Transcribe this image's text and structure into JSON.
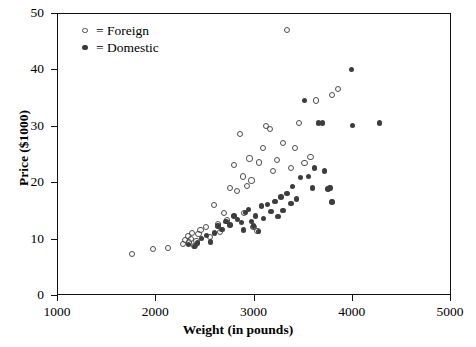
{
  "chart_data": {
    "type": "scatter",
    "title": "",
    "xlabel": "Weight (in pounds)",
    "ylabel": "Price ($1000)",
    "xlim": [
      1000,
      5000
    ],
    "ylim": [
      0,
      50
    ],
    "xticks": [
      1000,
      2000,
      3000,
      4000,
      5000
    ],
    "yticks": [
      0,
      10,
      20,
      30,
      40,
      50
    ],
    "grid": false,
    "legend_position": "upper-left-inside",
    "series": [
      {
        "name": "Foreign",
        "marker": "open-circle",
        "color": "#4d4d4d",
        "points": [
          [
            1760,
            7.3
          ],
          [
            1980,
            8.2
          ],
          [
            2130,
            8.4
          ],
          [
            2280,
            9.1
          ],
          [
            2300,
            9.8
          ],
          [
            2330,
            10.4
          ],
          [
            2340,
            9.3
          ],
          [
            2360,
            10.0
          ],
          [
            2370,
            11.0
          ],
          [
            2400,
            8.7
          ],
          [
            2420,
            9.6
          ],
          [
            2440,
            10.8
          ],
          [
            2460,
            11.5
          ],
          [
            2520,
            12.0
          ],
          [
            2560,
            10.3
          ],
          [
            2600,
            16.0
          ],
          [
            2640,
            12.6
          ],
          [
            2660,
            11.2
          ],
          [
            2700,
            14.6
          ],
          [
            2730,
            13.2
          ],
          [
            2760,
            19.0
          ],
          [
            2800,
            23.0
          ],
          [
            2830,
            18.5
          ],
          [
            2860,
            28.5
          ],
          [
            2890,
            21.0
          ],
          [
            2900,
            14.5
          ],
          [
            2930,
            19.3
          ],
          [
            2960,
            24.2
          ],
          [
            2980,
            20.3
          ],
          [
            3000,
            12.0
          ],
          [
            3040,
            11.4
          ],
          [
            3060,
            23.5
          ],
          [
            3100,
            26.0
          ],
          [
            3130,
            30.0
          ],
          [
            3170,
            29.5
          ],
          [
            3200,
            22.0
          ],
          [
            3240,
            24.0
          ],
          [
            3300,
            27.0
          ],
          [
            3340,
            47.0
          ],
          [
            3380,
            22.5
          ],
          [
            3420,
            26.0
          ],
          [
            3460,
            30.5
          ],
          [
            3520,
            23.4
          ],
          [
            3580,
            24.5
          ],
          [
            3640,
            34.5
          ],
          [
            3800,
            35.5
          ],
          [
            3860,
            36.5
          ]
        ]
      },
      {
        "name": "Domestic",
        "marker": "filled-circle",
        "color": "#3d3d3d",
        "points": [
          [
            2340,
            9.0
          ],
          [
            2400,
            8.6
          ],
          [
            2430,
            9.2
          ],
          [
            2470,
            10.0
          ],
          [
            2520,
            10.6
          ],
          [
            2560,
            9.4
          ],
          [
            2600,
            11.0
          ],
          [
            2640,
            12.2
          ],
          [
            2680,
            11.6
          ],
          [
            2720,
            13.0
          ],
          [
            2760,
            12.4
          ],
          [
            2800,
            14.0
          ],
          [
            2840,
            13.4
          ],
          [
            2880,
            12.8
          ],
          [
            2900,
            11.5
          ],
          [
            2920,
            14.6
          ],
          [
            2950,
            15.2
          ],
          [
            2980,
            13.0
          ],
          [
            3000,
            12.2
          ],
          [
            3020,
            14.0
          ],
          [
            3050,
            11.3
          ],
          [
            3080,
            15.8
          ],
          [
            3100,
            13.6
          ],
          [
            3140,
            16.0
          ],
          [
            3180,
            14.8
          ],
          [
            3220,
            16.6
          ],
          [
            3250,
            13.9
          ],
          [
            3280,
            17.4
          ],
          [
            3300,
            15.0
          ],
          [
            3340,
            18.0
          ],
          [
            3380,
            16.2
          ],
          [
            3400,
            19.2
          ],
          [
            3440,
            17.0
          ],
          [
            3480,
            20.8
          ],
          [
            3520,
            34.5
          ],
          [
            3560,
            21.0
          ],
          [
            3600,
            19.0
          ],
          [
            3620,
            22.5
          ],
          [
            3660,
            30.5
          ],
          [
            3700,
            30.5
          ],
          [
            3720,
            22.0
          ],
          [
            3760,
            18.8
          ],
          [
            3780,
            19.0
          ],
          [
            3800,
            16.5
          ],
          [
            4000,
            40.0
          ],
          [
            4010,
            30.0
          ],
          [
            4280,
            30.5
          ]
        ]
      }
    ]
  },
  "legend": {
    "entries": [
      {
        "symbol": "open-circle",
        "label": "= Foreign"
      },
      {
        "symbol": "filled-circle",
        "label": "= Domestic"
      }
    ]
  },
  "axes": {
    "x_tick_labels": [
      "1000",
      "2000",
      "3000",
      "4000",
      "5000"
    ],
    "y_tick_labels": [
      "0",
      "10",
      "20",
      "30",
      "40",
      "50"
    ],
    "x_axis_title": "Weight (in pounds)",
    "y_axis_title": "Price ($1000)"
  }
}
